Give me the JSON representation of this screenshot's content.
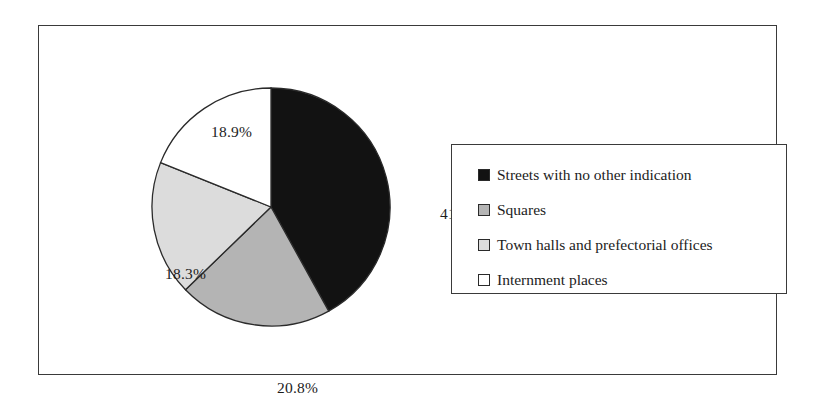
{
  "chart_data": {
    "type": "pie",
    "title": "",
    "xlabel": "",
    "ylabel": "",
    "legend_position": "right",
    "grid": false,
    "start_angle_deg": 0,
    "direction": "clockwise",
    "categories": [
      "Streets with no other indication",
      "Squares",
      "Town halls and prefectorial offices",
      "Internment places"
    ],
    "values": [
      41.9,
      20.8,
      18.3,
      18.9
    ],
    "value_unit": "%",
    "data_labels": [
      "41.9%",
      "20.8%",
      "18.3%",
      "18.9%"
    ],
    "slice_colors": [
      "#121212",
      "#b4b4b4",
      "#dcdcdc",
      "#ffffff"
    ],
    "slice_edge_color": "#2a2a2a"
  },
  "pie": {
    "labels": [
      {
        "text": "41.9%"
      },
      {
        "text": "20.8%"
      },
      {
        "text": "18.3%"
      },
      {
        "text": "18.9%"
      }
    ]
  },
  "legend": {
    "items": [
      {
        "label": "Streets with no other indication",
        "swatch": "#121212",
        "swatch_name": "legend-swatch-black"
      },
      {
        "label": "Squares",
        "swatch": "#b4b4b4",
        "swatch_name": "legend-swatch-medium-gray"
      },
      {
        "label": "Town halls and prefectorial offices",
        "swatch": "#dcdcdc",
        "swatch_name": "legend-swatch-light-gray"
      },
      {
        "label": "Internment places",
        "swatch": "#ffffff",
        "swatch_name": "legend-swatch-white"
      }
    ]
  },
  "style": {
    "frame_color": "#3a3a3a",
    "text_color": "#1c1c1c",
    "background": "#ffffff"
  }
}
